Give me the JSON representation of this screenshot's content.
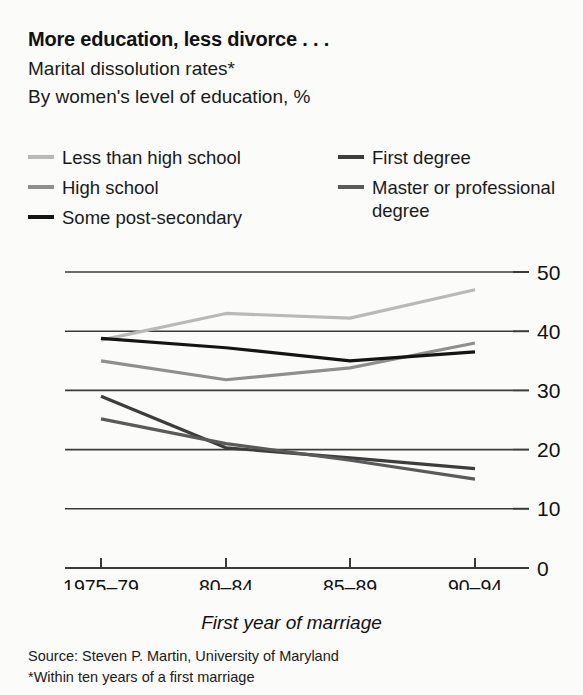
{
  "header": {
    "title": "More education, less divorce . . .",
    "subtitle_1": "Marital dissolution rates*",
    "subtitle_2": "By women's level of education, %"
  },
  "footer": {
    "axis_caption": "First year of marriage",
    "source": "Source: Steven P. Martin, University of Maryland",
    "footnote": "*Within ten years of a first marriage"
  },
  "colors": {
    "background": "#fbfbf9",
    "text": "#111111",
    "gridline": "#3a3a3a",
    "series_light_grey": "#b9b9b9",
    "series_mid_grey": "#8f8f8f",
    "series_black": "#141414",
    "series_dark_grey": "#5a5a5a",
    "series_darker_grey": "#3d3d3d"
  },
  "legend": {
    "entries": [
      {
        "label": "Less than high school",
        "color": "#b9b9b9"
      },
      {
        "label": "High school",
        "color": "#8f8f8f"
      },
      {
        "label": "Some post-secondary",
        "color": "#141414"
      },
      {
        "label": "First degree",
        "color": "#3d3d3d"
      },
      {
        "label": "Master or professional degree",
        "color": "#5a5a5a"
      }
    ]
  },
  "chart_data": {
    "type": "line",
    "title": "More education, less divorce . . .",
    "subtitle": "Marital dissolution rates* — By women's level of education, %",
    "xlabel": "First year of marriage",
    "ylabel": "",
    "categories": [
      "1975–79",
      "80–84",
      "85–89",
      "90–94"
    ],
    "ytick_labels": [
      "0",
      "10",
      "20",
      "30",
      "40",
      "50"
    ],
    "ylim": [
      0,
      50
    ],
    "ytick_values": [
      0,
      10,
      20,
      30,
      40,
      50
    ],
    "grid": true,
    "legend_position": "top",
    "series": [
      {
        "name": "Less than high school",
        "color": "#b9b9b9",
        "values": [
          38.5,
          43.0,
          42.2,
          47.0
        ]
      },
      {
        "name": "High school",
        "color": "#8f8f8f",
        "values": [
          35.0,
          31.8,
          33.8,
          38.0
        ]
      },
      {
        "name": "Some post-secondary",
        "color": "#141414",
        "values": [
          38.8,
          37.2,
          35.0,
          36.5
        ]
      },
      {
        "name": "First degree",
        "color": "#3d3d3d",
        "values": [
          29.0,
          20.3,
          18.6,
          16.8
        ]
      },
      {
        "name": "Master or professional degree",
        "color": "#5a5a5a",
        "values": [
          25.2,
          21.0,
          18.2,
          15.0
        ]
      }
    ]
  }
}
